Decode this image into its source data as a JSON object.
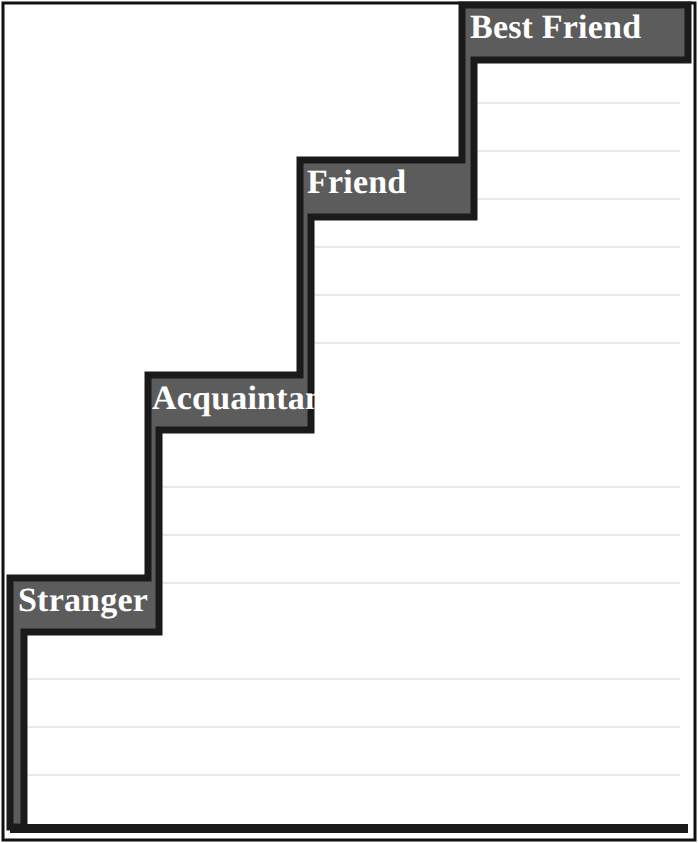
{
  "page": {
    "background_color": "#ffffff",
    "width": 698,
    "height": 843
  },
  "theme": {
    "band_fill": "#5c5c5c",
    "band_outline": "#1a1a1a",
    "label_text_color": "#ffffff",
    "ruled_line_color": "#e9e9e9",
    "page_border_color": "#111111",
    "writing_area_color": "#ffffff"
  },
  "diagram": {
    "type": "staircase",
    "step_count": 4,
    "direction": "ascending-left-to-right",
    "steps": [
      {
        "id": "stranger",
        "label": "Stranger",
        "order": 1,
        "level": "lowest",
        "writing_lines": 3
      },
      {
        "id": "acquaintance",
        "label": "Acquaintance",
        "order": 2,
        "level": "second",
        "writing_lines": 3
      },
      {
        "id": "friend",
        "label": "Friend",
        "order": 3,
        "level": "third",
        "writing_lines": 3
      },
      {
        "id": "best-friend",
        "label": "Best Friend",
        "order": 4,
        "level": "highest",
        "writing_lines": 3
      }
    ]
  },
  "ruled_lines": {
    "spacing_px": 48,
    "first_line_y": 103,
    "y_positions": [
      103,
      151,
      199,
      247,
      295,
      343,
      391,
      439,
      487,
      535,
      583,
      631,
      679,
      727,
      775
    ]
  }
}
